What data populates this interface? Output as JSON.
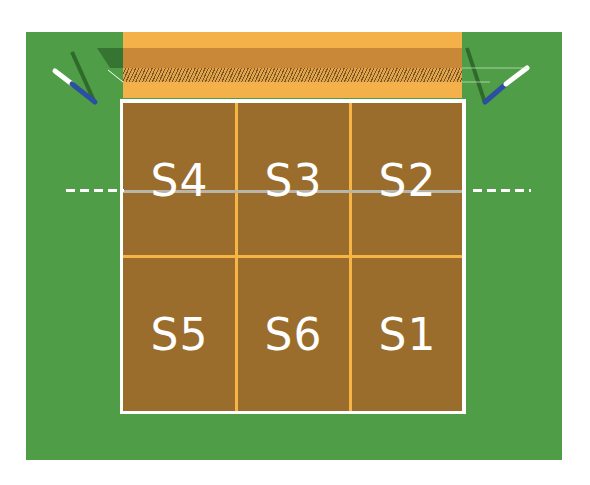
{
  "diagram": {
    "zones": [
      {
        "label": "S4",
        "row": "front",
        "col": 0
      },
      {
        "label": "S3",
        "row": "front",
        "col": 1
      },
      {
        "label": "S2",
        "row": "front",
        "col": 2
      },
      {
        "label": "S5",
        "row": "back",
        "col": 0
      },
      {
        "label": "S6",
        "row": "back",
        "col": 1
      },
      {
        "label": "S1",
        "row": "back",
        "col": 2
      }
    ],
    "colors": {
      "surround": "#4f9e47",
      "court": "#9a6d2d",
      "court_lines": "#f7b545",
      "boundary": "#ffffff",
      "far_band": "#f4b14a",
      "net_post": "#2c4fa3"
    }
  }
}
